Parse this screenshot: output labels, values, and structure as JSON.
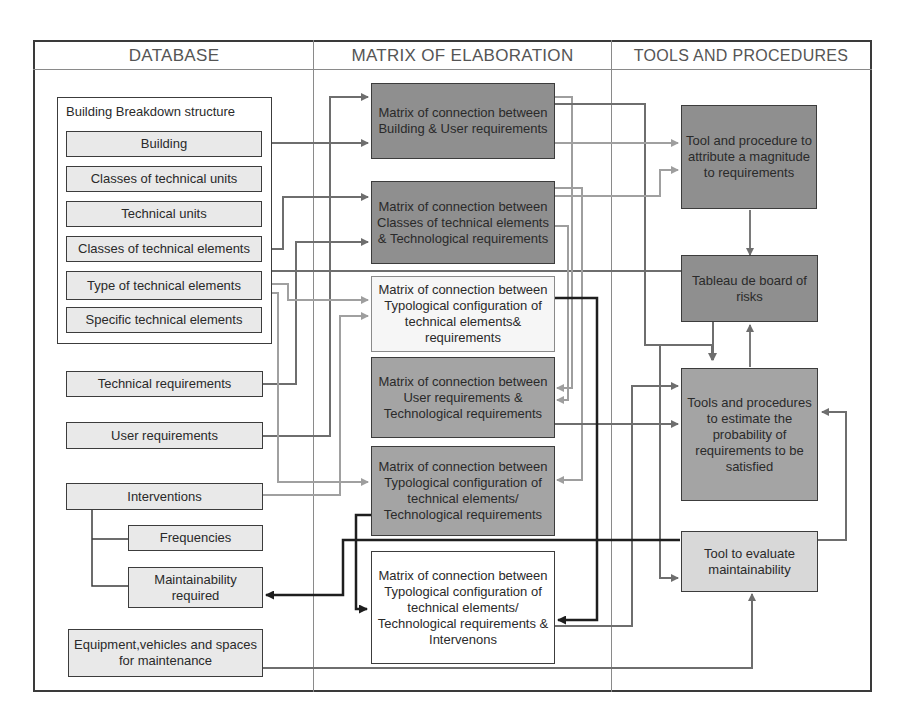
{
  "columns": {
    "database": "DATABASE",
    "matrix": "MATRIX OF ELABORATION",
    "tools": "TOOLS AND PROCEDURES"
  },
  "database": {
    "bbs_group_label": "Building Breakdown structure",
    "bbs_items": [
      "Building",
      "Classes of technical units",
      "Technical units",
      "Classes of technical elements",
      "Type of technical elements",
      "Specific technical elements"
    ],
    "technical_requirements": "Technical requirements",
    "user_requirements": "User requirements",
    "interventions": "Interventions",
    "frequencies": "Frequencies",
    "maintainability_required": "Maintainability required",
    "equipment": "Equipment,vehicles and spaces for maintenance"
  },
  "matrices": [
    "Matrix of connection between Building & User requirements",
    "Matrix of connection between Classes of technical elements & Technological requirements",
    "Matrix of connection between Typological configuration of technical elements& requirements",
    "Matrix of connection between User requirements & Technological requirements",
    "Matrix of connection between Typological configuration of technical elements/ Technological requirements",
    "Matrix of connection between Typological configuration of technical elements/ Technological requirements & Intervenons"
  ],
  "tools": [
    "Tool and procedure to attribute a magnitude to requirements",
    "Tableau de board of risks",
    "Tools and procedures to estimate the probability of requirements to be satisfied",
    "Tool to evaluate maintainability"
  ],
  "colors": {
    "dark_box": "#8f8f8f",
    "mid_box": "#a4a4a4",
    "light_box": "#f6f6f6",
    "db_box": "#e9e9e9",
    "connector_gray": "#7a7a7a",
    "connector_light": "#a8a8a8",
    "connector_dark": "#1e1e1e"
  }
}
